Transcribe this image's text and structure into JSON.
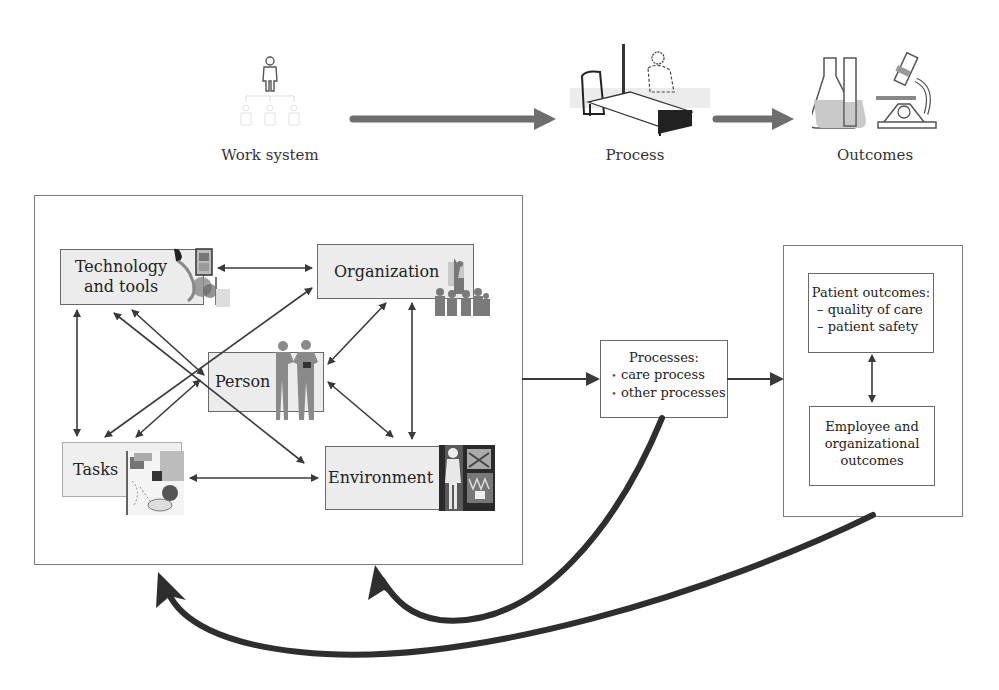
{
  "top_row": {
    "work_system_label": "Work system",
    "process_label": "Process",
    "outcomes_label": "Outcomes",
    "icons": [
      "hierarchy-people-icon",
      "hospital-bed-icon",
      "lab-flask-microscope-icon"
    ]
  },
  "work_system": {
    "nodes": {
      "technology": {
        "line1": "Technology",
        "line2": "and tools"
      },
      "organization": "Organization",
      "person": "Person",
      "tasks": "Tasks",
      "environment": "Environment"
    }
  },
  "processes": {
    "title": "Processes:",
    "items": [
      "care process",
      "other processes"
    ],
    "bullet": "•"
  },
  "outcomes": {
    "patient": {
      "title": "Patient outcomes:",
      "items": [
        "– quality of care",
        "– patient safety"
      ]
    },
    "employee": {
      "line1": "Employee and",
      "line2": "organizational",
      "line3": "outcomes"
    }
  },
  "colors": {
    "arrow": "#3a3a3a",
    "big_arrow": "#6e6e6e",
    "node_fill": "#ececec",
    "border": "#6a6a6a"
  }
}
